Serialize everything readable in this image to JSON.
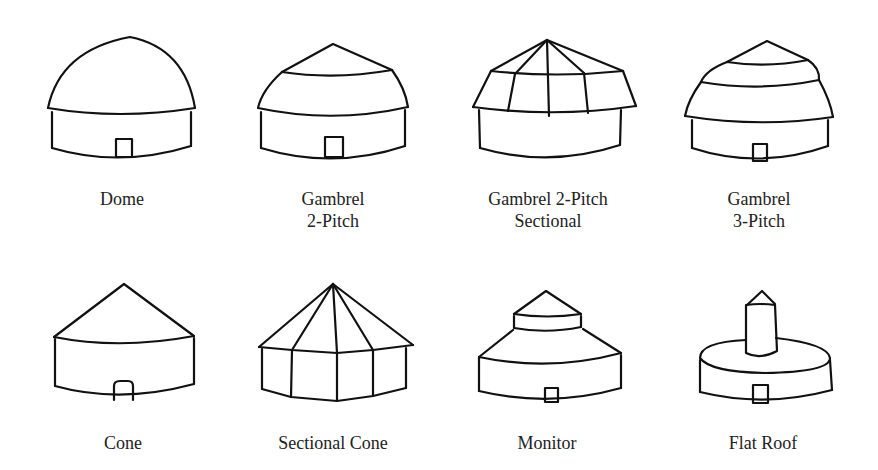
{
  "figure": {
    "items": [
      {
        "name": "Dome",
        "line1": "Dome",
        "line2": ""
      },
      {
        "name": "Gambrel 2-Pitch",
        "line1": "Gambrel",
        "line2": "2-Pitch"
      },
      {
        "name": "Gambrel 2-Pitch Sectional",
        "line1": "Gambrel 2-Pitch",
        "line2": "Sectional"
      },
      {
        "name": "Gambrel 3-Pitch",
        "line1": "Gambrel",
        "line2": "3-Pitch"
      },
      {
        "name": "Cone",
        "line1": "Cone",
        "line2": ""
      },
      {
        "name": "Sectional Cone",
        "line1": "Sectional Cone",
        "line2": ""
      },
      {
        "name": "Monitor",
        "line1": "Monitor",
        "line2": ""
      },
      {
        "name": "Flat Roof",
        "line1": "Flat Roof",
        "line2": ""
      }
    ]
  }
}
